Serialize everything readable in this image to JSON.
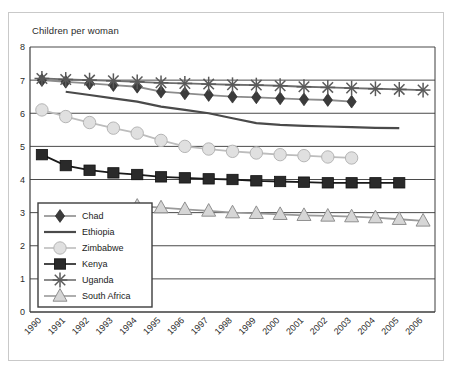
{
  "chart_data": {
    "type": "line",
    "title": "Children per woman",
    "xlabel": "",
    "ylabel": "",
    "ylim": [
      0,
      8
    ],
    "yticks": [
      0,
      1,
      2,
      3,
      4,
      5,
      6,
      7,
      8
    ],
    "grid": true,
    "legend_position": "lower-left-inside",
    "categories": [
      "1990",
      "1991",
      "1992",
      "1993",
      "1994",
      "1995",
      "1996",
      "1997",
      "1998",
      "1999",
      "2000",
      "2001",
      "2002",
      "2003",
      "2004",
      "2005",
      "2006"
    ],
    "series": [
      {
        "name": "Chad",
        "marker": "diamond",
        "color": "#3b3b3b",
        "line_color": "#8c8c8c",
        "values": [
          7.0,
          6.95,
          6.9,
          6.85,
          6.8,
          6.65,
          6.6,
          6.55,
          6.5,
          6.48,
          6.45,
          6.42,
          6.4,
          6.35,
          null,
          null,
          null
        ]
      },
      {
        "name": "Ethiopia",
        "marker": "none",
        "color": "#4a4a4a",
        "line_color": "#4a4a4a",
        "values": [
          null,
          6.65,
          6.55,
          6.45,
          6.35,
          6.2,
          6.1,
          6.0,
          5.85,
          5.7,
          5.65,
          5.62,
          5.6,
          5.58,
          5.56,
          5.55,
          null
        ]
      },
      {
        "name": "Zimbabwe",
        "marker": "circle",
        "color": "#e0e0e0",
        "line_color": "#bdbdbd",
        "values": [
          6.1,
          5.9,
          5.72,
          5.55,
          5.4,
          5.18,
          5.0,
          4.92,
          4.85,
          4.8,
          4.75,
          4.72,
          4.68,
          4.65,
          null,
          null,
          null
        ]
      },
      {
        "name": "Kenya",
        "marker": "square",
        "color": "#2a2a2a",
        "line_color": "#1a1a1a",
        "values": [
          4.75,
          4.42,
          4.28,
          4.2,
          4.15,
          4.08,
          4.05,
          4.02,
          4.0,
          3.96,
          3.94,
          3.92,
          3.9,
          3.9,
          3.9,
          3.9,
          null
        ]
      },
      {
        "name": "Uganda",
        "marker": "asterisk",
        "color": "#5a5a5a",
        "line_color": "#6e6e6e",
        "values": [
          7.05,
          7.02,
          7.0,
          6.98,
          6.95,
          6.92,
          6.9,
          6.88,
          6.86,
          6.85,
          6.83,
          6.8,
          6.78,
          6.76,
          6.74,
          6.72,
          6.7
        ]
      },
      {
        "name": "South Africa",
        "marker": "triangle",
        "color": "#d6d6d6",
        "line_color": "#9a9a9a",
        "values": [
          null,
          null,
          null,
          null,
          3.2,
          3.15,
          3.1,
          3.05,
          3.0,
          2.98,
          2.95,
          2.92,
          2.9,
          2.88,
          2.85,
          2.8,
          2.75
        ]
      }
    ]
  },
  "legend": {
    "items": [
      {
        "label": "Chad"
      },
      {
        "label": "Ethiopia"
      },
      {
        "label": "Zimbabwe"
      },
      {
        "label": "Kenya"
      },
      {
        "label": "Uganda"
      },
      {
        "label": "South Africa"
      }
    ]
  },
  "colors": {
    "plot_border": "#3d3d3d",
    "gridline": "#4a4a4a",
    "outer_border": "#c9c9c9",
    "background": "#ffffff",
    "text": "#2b2b2b"
  }
}
